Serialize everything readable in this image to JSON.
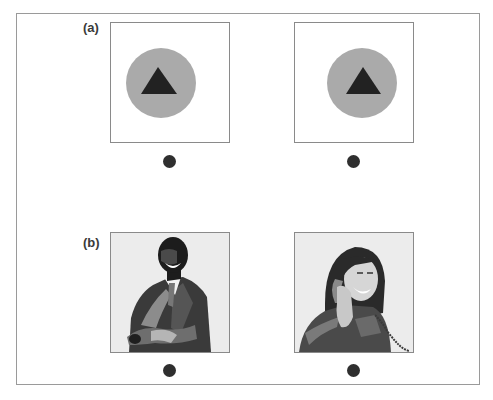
{
  "figure": {
    "panels": [
      {
        "label": "(a)",
        "stimuli": [
          {
            "type": "gray-circle-with-black-triangle",
            "circle_color": "#aaaaaa",
            "triangle_color": "#222222",
            "position": "centered"
          },
          {
            "type": "gray-circle-with-black-triangle",
            "circle_color": "#aaaaaa",
            "triangle_color": "#222222",
            "position": "offset-right"
          }
        ],
        "fixation_dots": 2
      },
      {
        "label": "(b)",
        "stimuli": [
          {
            "type": "illustration",
            "subject": "smiling man in suit with arms crossed"
          },
          {
            "type": "illustration",
            "subject": "smiling woman talking on telephone"
          }
        ],
        "fixation_dots": 2
      }
    ],
    "colors": {
      "border": "#8a8a8a",
      "dot": "#2f2f2f",
      "circle": "#aaaaaa",
      "triangle": "#222222",
      "label": "#3a3a3a"
    }
  }
}
